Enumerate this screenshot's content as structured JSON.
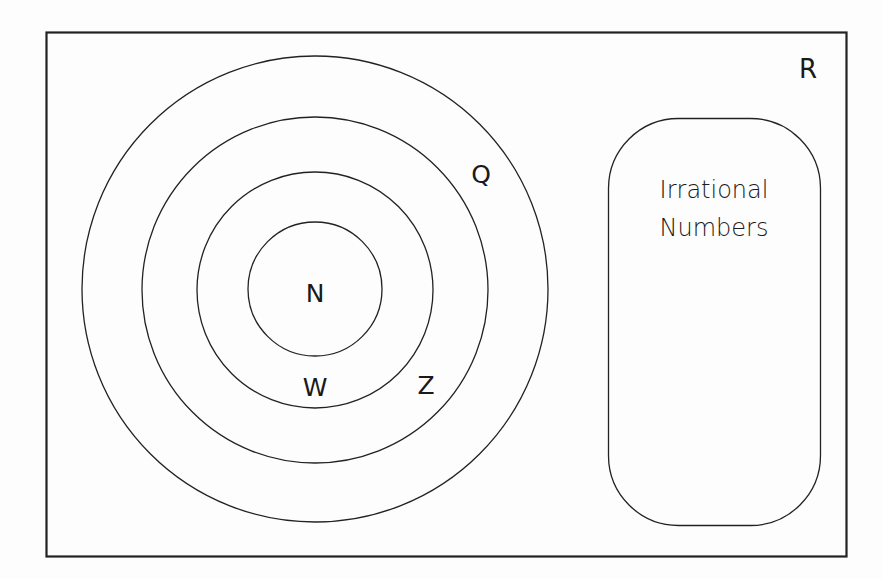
{
  "diagram": {
    "type": "venn",
    "universe": {
      "label": "R",
      "meaning": "Real Numbers"
    },
    "nested_sets": [
      {
        "label": "N",
        "order": 1
      },
      {
        "label": "W",
        "order": 2
      },
      {
        "label": "Z",
        "order": 3
      },
      {
        "label": "Q",
        "order": 4
      }
    ],
    "disjoint_set": {
      "label_line1": "Irrational",
      "label_line2": "Numbers"
    },
    "colors": {
      "stroke": "#222222",
      "background": "#fdfdfd",
      "text": "#1a1a1a"
    }
  }
}
